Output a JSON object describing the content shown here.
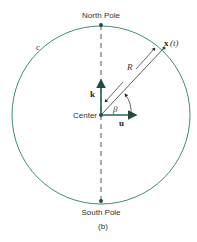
{
  "labels": {
    "north_pole": "North Pole",
    "south_pole": "South Pole",
    "center": "Center",
    "curve": "c",
    "position": "x",
    "position_arg": "(t)",
    "radius": "R",
    "angle": "β",
    "k_vector": "k",
    "u_vector": "u",
    "caption": "(b)"
  },
  "colors": {
    "stroke": "#2e7d6b",
    "text": "#333333"
  }
}
